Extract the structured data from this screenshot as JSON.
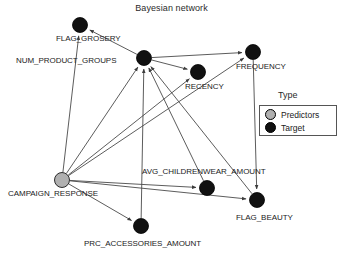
{
  "chart_data": {
    "type": "diagram",
    "title": "Bayesian network",
    "diagram_kind": "bayesian-network",
    "legend": {
      "title": "Type",
      "entries": [
        {
          "label": "Predictors",
          "color": "#b0b0b0",
          "shape": "circle"
        },
        {
          "label": "Target",
          "color": "#111111",
          "shape": "circle"
        }
      ]
    },
    "nodes": [
      {
        "id": "FLAG_GROSERY",
        "label": "FLAG_GROSERY",
        "type": "Target",
        "color": "#111111",
        "x": 80,
        "y": 25,
        "r": 7.5,
        "label_x": 56,
        "label_y": 34
      },
      {
        "id": "NUM_PRODUCT_GROUPS",
        "label": "NUM_PRODUCT_GROUPS",
        "type": "Target",
        "color": "#111111",
        "x": 144,
        "y": 58,
        "r": 7.5,
        "label_x": 16,
        "label_y": 56
      },
      {
        "id": "FREQUENCY",
        "label": "FREQUENCY",
        "type": "Target",
        "color": "#111111",
        "x": 253,
        "y": 52,
        "r": 7.5,
        "label_x": 236,
        "label_y": 62
      },
      {
        "id": "RECENCY",
        "label": "RECENCY",
        "type": "Target",
        "color": "#111111",
        "x": 198,
        "y": 72,
        "r": 7.5,
        "label_x": 185,
        "label_y": 82
      },
      {
        "id": "AVG_CHILDRENWEAR_AMOUNT",
        "label": "AVG_CHILDRENWEAR_AMOUNT",
        "type": "Target",
        "color": "#111111",
        "x": 207,
        "y": 188,
        "r": 7.5,
        "label_x": 142,
        "label_y": 167
      },
      {
        "id": "FLAG_BEAUTY",
        "label": "FLAG_BEAUTY",
        "type": "Target",
        "color": "#111111",
        "x": 257,
        "y": 200,
        "r": 7.5,
        "label_x": 236,
        "label_y": 213
      },
      {
        "id": "CAMPAIGN_RESPONSE",
        "label": "CAMPAIGN_RESPONSE",
        "type": "Predictors",
        "color": "#b0b0b0",
        "x": 62,
        "y": 180,
        "r": 7.5,
        "label_x": 8,
        "label_y": 189
      },
      {
        "id": "PRC_ACCESSORIES_AMOUNT",
        "label": "PRC_ACCESSORIES_AMOUNT",
        "type": "Target",
        "color": "#111111",
        "x": 141,
        "y": 226,
        "r": 7.5,
        "label_x": 84,
        "label_y": 239
      }
    ],
    "edges": [
      {
        "from": "CAMPAIGN_RESPONSE",
        "to": "FLAG_GROSERY"
      },
      {
        "from": "NUM_PRODUCT_GROUPS",
        "to": "FLAG_GROSERY"
      },
      {
        "from": "CAMPAIGN_RESPONSE",
        "to": "NUM_PRODUCT_GROUPS"
      },
      {
        "from": "PRC_ACCESSORIES_AMOUNT",
        "to": "NUM_PRODUCT_GROUPS"
      },
      {
        "from": "AVG_CHILDRENWEAR_AMOUNT",
        "to": "NUM_PRODUCT_GROUPS"
      },
      {
        "from": "FLAG_BEAUTY",
        "to": "NUM_PRODUCT_GROUPS"
      },
      {
        "from": "NUM_PRODUCT_GROUPS",
        "to": "RECENCY"
      },
      {
        "from": "CAMPAIGN_RESPONSE",
        "to": "RECENCY"
      },
      {
        "from": "NUM_PRODUCT_GROUPS",
        "to": "FREQUENCY"
      },
      {
        "from": "CAMPAIGN_RESPONSE",
        "to": "FREQUENCY"
      },
      {
        "from": "CAMPAIGN_RESPONSE",
        "to": "AVG_CHILDRENWEAR_AMOUNT"
      },
      {
        "from": "CAMPAIGN_RESPONSE",
        "to": "FLAG_BEAUTY"
      },
      {
        "from": "FREQUENCY",
        "to": "FLAG_BEAUTY"
      },
      {
        "from": "CAMPAIGN_RESPONSE",
        "to": "PRC_ACCESSORIES_AMOUNT"
      }
    ],
    "edge_color": "#4a4a4a",
    "node_stroke": "#000000"
  }
}
